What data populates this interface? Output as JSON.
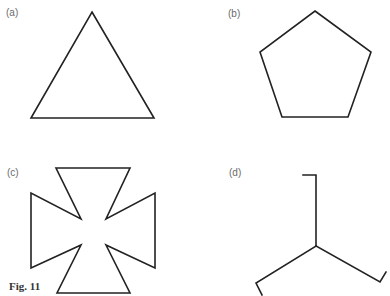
{
  "figure": {
    "caption": "Fig. 11",
    "panels": [
      {
        "id": "a",
        "label": "(a)",
        "shape": "equilateral-triangle"
      },
      {
        "id": "b",
        "label": "(b)",
        "shape": "regular-pentagon"
      },
      {
        "id": "c",
        "label": "(c)",
        "shape": "cross-pattee"
      },
      {
        "id": "d",
        "label": "(d)",
        "shape": "three-armed-hooked-tripod"
      }
    ]
  },
  "colors": {
    "stroke": "#222222",
    "label": "#6a6a6a",
    "background": "#ffffff"
  }
}
